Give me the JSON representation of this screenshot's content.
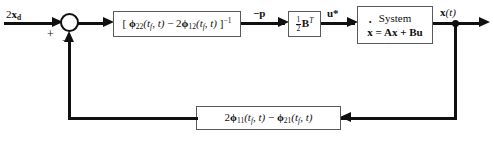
{
  "diagram": {
    "colors": {
      "wire": "#101010",
      "block_border": "#5a5a5a",
      "background": "#ffffff"
    },
    "signals": {
      "input_label": "2x_d",
      "input_label_main": "2",
      "input_label_bold": "x",
      "input_label_sub": "d",
      "sum_plus": "+",
      "sum_minus": "−",
      "costate_label": "−p",
      "control_label": "u*",
      "output_label": "x(t)"
    },
    "blocks": {
      "inverse_block": {
        "name": "inverse-gain-block",
        "text": "[ φ₂₂(t_f, t) − 2φ₁₂(t_f, t) ]⁻¹",
        "open_bracket": "[",
        "phi1": "ϕ",
        "phi1_sub": "22",
        "phi1_args": "(t",
        "phi1_args_sub": "f",
        "phi1_args_rest": ", t)",
        "minus": "−",
        "coeff2": "2",
        "phi2": "ϕ",
        "phi2_sub": "12",
        "close_bracket": "]",
        "exponent": "−1"
      },
      "gain_block": {
        "name": "half-b-transpose-block",
        "numerator": "1",
        "denominator": "2",
        "matrix": "B",
        "exponent": "T"
      },
      "system_block": {
        "name": "system-block",
        "title": "System",
        "state_symbol": "x",
        "equation_rest": " = Ax + Bu",
        "equation_full": "ẋ = Ax + Bu"
      },
      "feedback_block": {
        "name": "feedback-gain-block",
        "text": "2φ₁₁(t_f, t) − φ₂₁(t_f, t)",
        "coeff2": "2",
        "phi1": "ϕ",
        "phi1_sub": "11",
        "phi1_args": "(t",
        "phi1_args_sub": "f",
        "phi1_args_rest": ", t)",
        "minus": "−",
        "phi2": "ϕ",
        "phi2_sub": "21"
      }
    }
  }
}
